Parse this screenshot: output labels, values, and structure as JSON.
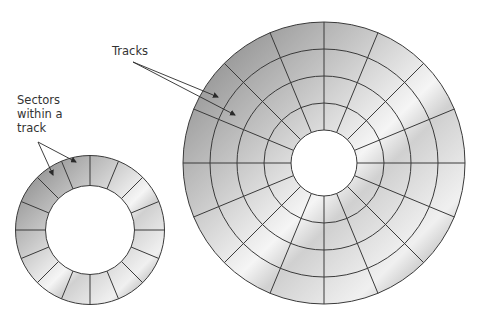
{
  "labels": {
    "tracks": "Tracks",
    "sectors_line1": "Sectors",
    "sectors_line2": "within a",
    "sectors_line3": "track"
  },
  "colors": {
    "line": "#3a3a3a",
    "shade_dark": "#8a8a8a",
    "shade_light": "#f4f4f4",
    "background": "#ffffff"
  },
  "large_disk": {
    "cx": 324,
    "cy": 163,
    "ring_radii": [
      33,
      60,
      87,
      114,
      141
    ],
    "sectors": 16
  },
  "small_disk": {
    "cx": 90,
    "cy": 230,
    "ring_radii": [
      44.5,
      74.5
    ],
    "sectors": 16
  },
  "arrows": {
    "tracks": [
      {
        "x1": 133,
        "y1": 62,
        "x2": 218,
        "y2": 97
      },
      {
        "x1": 133,
        "y1": 62,
        "x2": 235,
        "y2": 115
      }
    ],
    "sectors": [
      {
        "x1": 38,
        "y1": 142,
        "x2": 53,
        "y2": 175
      },
      {
        "x1": 38,
        "y1": 142,
        "x2": 76,
        "y2": 162
      }
    ]
  }
}
